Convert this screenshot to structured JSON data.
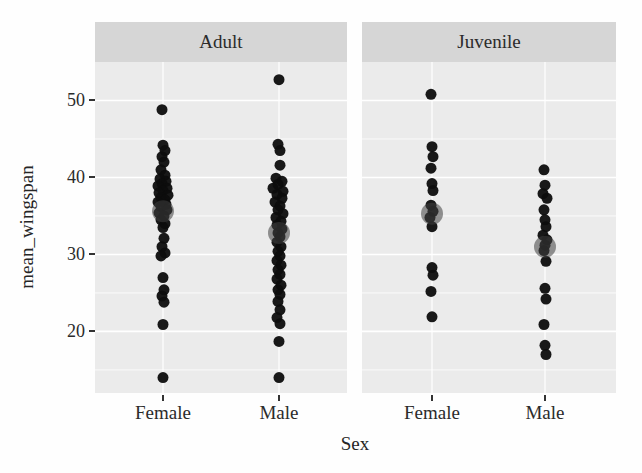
{
  "chart_data": {
    "type": "scatter",
    "title": "",
    "xlabel": "Sex",
    "ylabel": "mean_wingspan",
    "ylim": [
      12,
      55
    ],
    "y_ticks": [
      50,
      40,
      30,
      20
    ],
    "y_minor_gridlines": [
      45,
      35,
      25,
      15
    ],
    "grid": "on",
    "legend": "none",
    "point_style": "black jittered dots with large semi-transparent grey group-mean dot",
    "facets": [
      {
        "label": "Adult",
        "groups": [
          {
            "category": "Female",
            "mean": 35.6,
            "points": [
              [
                48.8,
                -1
              ],
              [
                44.2,
                0
              ],
              [
                43.5,
                2
              ],
              [
                42.7,
                -1
              ],
              [
                42.0,
                1
              ],
              [
                41.0,
                -2
              ],
              [
                40.3,
                2
              ],
              [
                39.8,
                -3
              ],
              [
                39.5,
                3
              ],
              [
                39.2,
                -1
              ],
              [
                38.9,
                -5
              ],
              [
                38.6,
                4
              ],
              [
                38.3,
                0
              ],
              [
                38.0,
                -4
              ],
              [
                37.7,
                5
              ],
              [
                37.4,
                -2
              ],
              [
                37.1,
                2
              ],
              [
                36.8,
                -5
              ],
              [
                36.5,
                3
              ],
              [
                36.2,
                -2
              ],
              [
                35.8,
                4
              ],
              [
                35.4,
                -4
              ],
              [
                35.0,
                1
              ],
              [
                34.5,
                -2
              ],
              [
                34.0,
                2
              ],
              [
                33.5,
                0
              ],
              [
                32.1,
                1
              ],
              [
                31.0,
                -1
              ],
              [
                30.2,
                2
              ],
              [
                29.8,
                -2
              ],
              [
                27.0,
                0
              ],
              [
                25.4,
                1
              ],
              [
                24.6,
                -1
              ],
              [
                23.8,
                1
              ],
              [
                20.9,
                0
              ],
              [
                14.0,
                0
              ]
            ]
          },
          {
            "category": "Male",
            "mean": 32.8,
            "points": [
              [
                52.7,
                0
              ],
              [
                44.3,
                -1
              ],
              [
                43.5,
                1
              ],
              [
                41.6,
                1
              ],
              [
                39.9,
                -3
              ],
              [
                39.5,
                3
              ],
              [
                39.1,
                -1
              ],
              [
                38.6,
                -6
              ],
              [
                38.2,
                4
              ],
              [
                37.8,
                -2
              ],
              [
                37.3,
                3
              ],
              [
                36.8,
                -4
              ],
              [
                36.3,
                1
              ],
              [
                35.8,
                -1
              ],
              [
                35.3,
                4
              ],
              [
                34.8,
                -3
              ],
              [
                34.3,
                2
              ],
              [
                33.8,
                -2
              ],
              [
                33.3,
                3
              ],
              [
                32.8,
                -1
              ],
              [
                32.3,
                1
              ],
              [
                31.6,
                -2
              ],
              [
                31.0,
                2
              ],
              [
                30.4,
                -1
              ],
              [
                29.8,
                1
              ],
              [
                29.2,
                -2
              ],
              [
                28.6,
                2
              ],
              [
                28.0,
                -1
              ],
              [
                27.4,
                1
              ],
              [
                26.8,
                -2
              ],
              [
                26.0,
                2
              ],
              [
                25.4,
                -1
              ],
              [
                24.8,
                1
              ],
              [
                23.9,
                -1
              ],
              [
                22.8,
                1
              ],
              [
                21.8,
                -2
              ],
              [
                21.0,
                1
              ],
              [
                18.7,
                0
              ],
              [
                14.0,
                0
              ]
            ]
          }
        ]
      },
      {
        "label": "Juvenile",
        "groups": [
          {
            "category": "Female",
            "mean": 35.3,
            "points": [
              [
                50.8,
                -1
              ],
              [
                44.0,
                0
              ],
              [
                42.7,
                1
              ],
              [
                41.2,
                -1
              ],
              [
                39.2,
                0
              ],
              [
                38.3,
                1
              ],
              [
                36.4,
                -1
              ],
              [
                35.6,
                1
              ],
              [
                34.8,
                -2
              ],
              [
                33.6,
                0
              ],
              [
                28.3,
                0
              ],
              [
                27.3,
                1
              ],
              [
                25.2,
                -1
              ],
              [
                21.9,
                0
              ]
            ]
          },
          {
            "category": "Male",
            "mean": 31.0,
            "points": [
              [
                41.0,
                -1
              ],
              [
                39.0,
                0
              ],
              [
                37.9,
                -2
              ],
              [
                37.3,
                2
              ],
              [
                35.8,
                -1
              ],
              [
                34.5,
                0
              ],
              [
                33.6,
                1
              ],
              [
                32.5,
                -2
              ],
              [
                31.9,
                2
              ],
              [
                31.2,
                0
              ],
              [
                30.5,
                -1
              ],
              [
                29.1,
                1
              ],
              [
                25.6,
                0
              ],
              [
                24.2,
                1
              ],
              [
                20.9,
                -1
              ],
              [
                18.2,
                0
              ],
              [
                17.0,
                1
              ]
            ]
          }
        ]
      }
    ],
    "colors": {
      "panel_bg": "#ebebeb",
      "strip_bg": "#d6d6d6",
      "gridline": "#ffffff",
      "point": "#0d0d0d",
      "mean_point": "#3f3f3f",
      "text": "#262626",
      "tick": "#333333"
    }
  }
}
